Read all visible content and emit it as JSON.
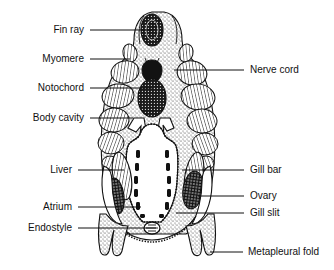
{
  "figure": {
    "background_color": "#ffffff",
    "line_color": "#111111"
  },
  "labels": {
    "left": [
      {
        "text": "Fin ray",
        "name": "label-fin-ray",
        "x": 84,
        "y": 33,
        "line_x1": 90,
        "line_x2": 152,
        "line_y": 30
      },
      {
        "text": "Myomere",
        "name": "label-myomere",
        "x": 84,
        "y": 62,
        "line_x1": 90,
        "line_x2": 130,
        "line_y": 59
      },
      {
        "text": "Notochord",
        "name": "label-notochord",
        "x": 84,
        "y": 91,
        "line_x1": 90,
        "line_x2": 152,
        "line_y": 88
      },
      {
        "text": "Body cavity",
        "name": "label-body-cavity",
        "x": 84,
        "y": 121,
        "line_x1": 90,
        "line_x2": 133,
        "line_y": 118
      },
      {
        "text": "Liver",
        "name": "label-liver",
        "x": 72,
        "y": 173,
        "line_x1": 78,
        "line_x2": 124,
        "line_y": 170
      },
      {
        "text": "Atrium",
        "name": "label-atrium",
        "x": 72,
        "y": 210,
        "line_x1": 78,
        "line_x2": 141,
        "line_y": 207
      },
      {
        "text": "Endostyle",
        "name": "label-endostyle",
        "x": 72,
        "y": 231,
        "line_x1": 78,
        "line_x2": 156,
        "line_y": 228
      }
    ],
    "right": [
      {
        "text": "Nerve cord",
        "name": "label-nerve-cord",
        "x": 250,
        "y": 73,
        "line_x1": 174,
        "line_x2": 244,
        "line_y": 70
      },
      {
        "text": "Gill bar",
        "name": "label-gill-bar",
        "x": 250,
        "y": 173,
        "line_x1": 182,
        "line_x2": 244,
        "line_y": 170
      },
      {
        "text": "Ovary",
        "name": "label-ovary",
        "x": 250,
        "y": 199,
        "line_x1": 198,
        "line_x2": 244,
        "line_y": 196
      },
      {
        "text": "Gill slit",
        "name": "label-gill-slit",
        "x": 250,
        "y": 216,
        "line_x1": 176,
        "line_x2": 244,
        "line_y": 213
      },
      {
        "text": "Metapleural fold",
        "name": "label-metapleural-fold",
        "x": 248,
        "y": 255,
        "line_x1": 210,
        "line_x2": 243,
        "line_y": 252
      }
    ]
  },
  "structures": {
    "fin_ray": "fin-ray",
    "dorsal_fin": "dorsal-fin",
    "myomere": "myomere-block",
    "nerve_cord": "nerve-cord",
    "notochord": "notochord",
    "body_cavity": "body-cavity",
    "pharynx": "pharynx-cavity",
    "gill_bar": "gill-bar",
    "gill_slit": "gill-slit",
    "liver": "liver-diverticulum",
    "ovary": "ovary",
    "atrium": "atrium-cavity",
    "endostyle": "endostyle",
    "metapleural_fold": "metapleural-fold",
    "body_wall": "body-wall"
  }
}
